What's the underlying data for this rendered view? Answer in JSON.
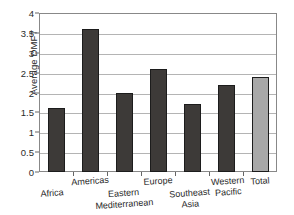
{
  "chart_data": {
    "type": "bar",
    "title": "",
    "xlabel": "",
    "ylabel": "Average DMFT",
    "categories": [
      "Africa",
      "Americas",
      "Eastern Mediterranean",
      "Europe",
      "Southeast Asia",
      "Western Pacific",
      "Total"
    ],
    "values": [
      1.6,
      3.6,
      2.0,
      2.6,
      1.7,
      2.2,
      2.4
    ],
    "ylim": [
      0,
      4
    ],
    "ytick_labels": [
      "0",
      "0.5",
      "1",
      "1.5",
      "2",
      "2.5",
      "3",
      "3.5",
      "4"
    ],
    "ytick_values": [
      0,
      0.5,
      1,
      1.5,
      2,
      2.5,
      3,
      3.5,
      4
    ],
    "grid": true,
    "legend": "none",
    "bar_colors": [
      "#3d3a38",
      "#3d3a38",
      "#3d3a38",
      "#3d3a38",
      "#3d3a38",
      "#3d3a38",
      "#a8a8a8"
    ],
    "bar_edge_color": "#1c1c1c",
    "gridline_color": "#b4b4b4",
    "axis_color": "#888888",
    "text_color": "#2a2a2a",
    "background": "#ffffff"
  },
  "x_label_rows": [
    {
      "text": "Africa",
      "row": "lower"
    },
    {
      "text": "Americas",
      "row": "upper"
    },
    {
      "text": "Eastern Mediterranean",
      "row": "lower"
    },
    {
      "text": "Europe",
      "row": "upper"
    },
    {
      "text": "Southeast Asia",
      "row": "lower"
    },
    {
      "text": "Western Pacific",
      "row": "split"
    },
    {
      "text": "Total",
      "row": "upper"
    }
  ]
}
